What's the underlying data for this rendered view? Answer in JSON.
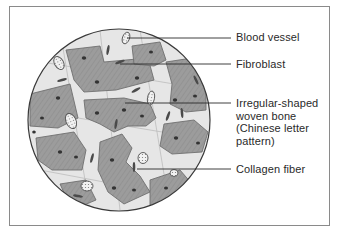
{
  "diagram": {
    "frame": {
      "x": 9,
      "y": 6,
      "width": 321,
      "height": 220,
      "border_color": "#8a8a8a"
    },
    "circle": {
      "cx": 119,
      "cy": 120,
      "r": 91,
      "outline_color": "#3a3a3a"
    },
    "colors": {
      "matrix": "#9c9c9c",
      "matrix_dark": "#868686",
      "background_tissue": "#e6e6e6",
      "nucleus": "#333333",
      "leader_line": "#2a2a2a",
      "text": "#2a2a2a"
    },
    "labels": [
      {
        "id": "blood-vessel",
        "text": "Blood vessel",
        "line": {
          "x1": 127,
          "y1": 38,
          "x2": 231,
          "y2": 38
        },
        "text_top": 31
      },
      {
        "id": "fibroblast",
        "text": "Fibroblast",
        "line": {
          "x1": 120,
          "y1": 64,
          "x2": 231,
          "y2": 64
        },
        "text_top": 58
      },
      {
        "id": "woven-bone",
        "text": "Irregular-shaped\nwoven bone\n(Chinese letter\npattern)",
        "line": {
          "x1": 125,
          "y1": 103,
          "x2": 231,
          "y2": 103
        },
        "text_top": 97
      },
      {
        "id": "collagen-fiber",
        "text": "Collagen fiber",
        "line": {
          "x1": 137,
          "y1": 169,
          "x2": 231,
          "y2": 169
        },
        "text_top": 163
      }
    ]
  }
}
